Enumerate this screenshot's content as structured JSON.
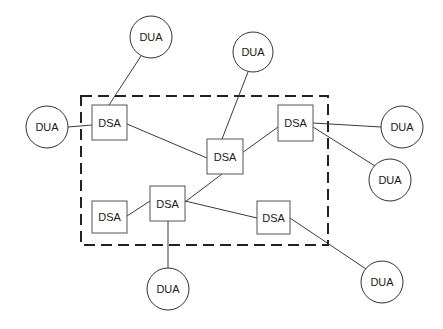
{
  "diagram": {
    "title": "",
    "boundary": {
      "label": "",
      "style": "dashed"
    },
    "nodes": [
      {
        "id": "dsa1",
        "type": "DSA",
        "label": "DSA"
      },
      {
        "id": "dsa2",
        "type": "DSA",
        "label": "DSA"
      },
      {
        "id": "dsa3",
        "type": "DSA",
        "label": "DSA"
      },
      {
        "id": "dsa4",
        "type": "DSA",
        "label": "DSA"
      },
      {
        "id": "dsa5",
        "type": "DSA",
        "label": "DSA"
      },
      {
        "id": "dsa6",
        "type": "DSA",
        "label": "DSA"
      },
      {
        "id": "dua1",
        "type": "DUA",
        "label": "DUA"
      },
      {
        "id": "dua2",
        "type": "DUA",
        "label": "DUA"
      },
      {
        "id": "dua3",
        "type": "DUA",
        "label": "DUA"
      },
      {
        "id": "dua4",
        "type": "DUA",
        "label": "DUA"
      },
      {
        "id": "dua5",
        "type": "DUA",
        "label": "DUA"
      },
      {
        "id": "dua6",
        "type": "DUA",
        "label": "DUA"
      },
      {
        "id": "dua7",
        "type": "DUA",
        "label": "DUA"
      }
    ],
    "edges": [
      {
        "from": "dua1",
        "to": "dsa1"
      },
      {
        "from": "dua2",
        "to": "dsa1"
      },
      {
        "from": "dsa1",
        "to": "dsa2"
      },
      {
        "from": "dua3",
        "to": "dsa2"
      },
      {
        "from": "dsa2",
        "to": "dsa3"
      },
      {
        "from": "dsa3",
        "to": "dua4"
      },
      {
        "from": "dsa3",
        "to": "dua5"
      },
      {
        "from": "dsa2",
        "to": "dsa5"
      },
      {
        "from": "dsa4",
        "to": "dsa5"
      },
      {
        "from": "dsa5",
        "to": "dsa6"
      },
      {
        "from": "dsa5",
        "to": "dua6"
      },
      {
        "from": "dsa6",
        "to": "dua7"
      }
    ]
  }
}
